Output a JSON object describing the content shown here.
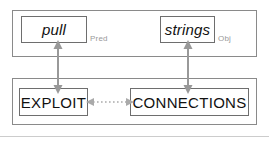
{
  "diagram": {
    "colors": {
      "panel_border": "#8a8a8a",
      "box_border": "#6e6e6e",
      "arrow": "#999999",
      "text": "#111111",
      "role_label": "#9a9a9a",
      "background": "#ffffff",
      "bottom_rule": "#cccccc"
    },
    "top_panel": {
      "name": "lexical-layer",
      "boxes": [
        {
          "id": "pull",
          "text": "pull",
          "style": "italic",
          "role_label": "Pred"
        },
        {
          "id": "strings",
          "text": "strings",
          "style": "italic",
          "role_label": "Obj"
        }
      ]
    },
    "bottom_panel": {
      "name": "concept-layer",
      "boxes": [
        {
          "id": "exploit",
          "text": "EXPLOIT",
          "style": "uppercase"
        },
        {
          "id": "connections",
          "text": "CONNECTIONS",
          "style": "uppercase"
        }
      ]
    },
    "connectors": [
      {
        "id": "pull-to-exploit",
        "from": "pull",
        "to": "EXPLOIT",
        "orientation": "vertical",
        "line": "solid",
        "heads": "double"
      },
      {
        "id": "strings-to-connections",
        "from": "strings",
        "to": "CONNECTIONS",
        "orientation": "vertical",
        "line": "solid",
        "heads": "double"
      },
      {
        "id": "exploit-to-connections",
        "from": "EXPLOIT",
        "to": "CONNECTIONS",
        "orientation": "horizontal",
        "line": "dotted",
        "heads": "double"
      }
    ]
  }
}
